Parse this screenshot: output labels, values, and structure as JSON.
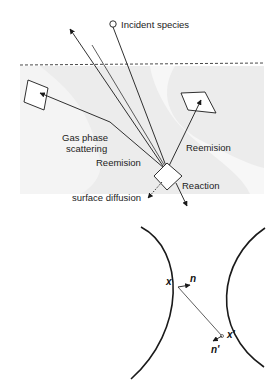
{
  "figure": {
    "top_panel": {
      "labels": {
        "incident": "Incident species",
        "gas_phase_1": "Gas phase",
        "gas_phase_2": "scattering",
        "reemision_left": "Reemision",
        "reemision_right": "Reemision",
        "reaction": "Reaction",
        "surface_diffusion": "surface diffusion"
      }
    },
    "bottom_panel": {
      "labels": {
        "x": "x",
        "n": "n",
        "x_prime": "x'",
        "n_prime": "n'"
      }
    },
    "colors": {
      "background": "#ffffff",
      "surface_fill": "#ededed",
      "stroke": "#1a1a1a"
    }
  }
}
